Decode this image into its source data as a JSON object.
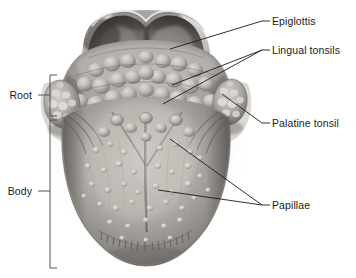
{
  "figure": {
    "style": "grayscale medical illustration",
    "width": 356,
    "height": 278,
    "background_color": "#ffffff",
    "text_color": "#1b1b1b",
    "leader_line_color": "#1b1b1b",
    "bracket_color": "#555555"
  },
  "labels": {
    "epiglottis": "Epiglottis",
    "lingual_tonsils": "Lingual tonsils",
    "palatine_tonsil": "Palatine tonsil",
    "papillae": "Papillae",
    "root": "Root",
    "body": "Body"
  },
  "callouts": [
    {
      "id": "epiglottis",
      "label": "Epiglottis",
      "side": "right",
      "text_x": 272,
      "text_y": 15,
      "dash_x1": 262,
      "dash_x2": 270,
      "dash_y": 21,
      "leaders": [
        {
          "x1": 262,
          "y1": 21,
          "x2": 170,
          "y2": 49
        }
      ]
    },
    {
      "id": "lingual-tonsils",
      "label": "Lingual tonsils",
      "side": "right",
      "text_x": 272,
      "text_y": 44,
      "dash_x1": 262,
      "dash_x2": 270,
      "dash_y": 50,
      "leaders": [
        {
          "x1": 262,
          "y1": 50,
          "x2": 172,
          "y2": 85
        },
        {
          "x1": 262,
          "y1": 50,
          "x2": 163,
          "y2": 104
        }
      ]
    },
    {
      "id": "palatine-tonsil",
      "label": "Palatine tonsil",
      "side": "right",
      "text_x": 272,
      "text_y": 117,
      "dash_x1": 262,
      "dash_x2": 270,
      "dash_y": 123,
      "leaders": [
        {
          "x1": 262,
          "y1": 123,
          "x2": 222,
          "y2": 94
        }
      ]
    },
    {
      "id": "papillae",
      "label": "Papillae",
      "side": "right",
      "text_x": 272,
      "text_y": 199,
      "dash_x1": 262,
      "dash_x2": 270,
      "dash_y": 205,
      "leaders": [
        {
          "x1": 262,
          "y1": 205,
          "x2": 170,
          "y2": 139
        },
        {
          "x1": 262,
          "y1": 205,
          "x2": 158,
          "y2": 190
        }
      ]
    }
  ],
  "brackets": [
    {
      "id": "root",
      "label": "Root",
      "text_x": 10,
      "text_y": 89,
      "tick_x1": 38,
      "tick_x2": 50,
      "tick_y": 95,
      "spine_x": 50,
      "spine_y1": 75,
      "spine_y2": 116,
      "arm_len": 7
    },
    {
      "id": "body",
      "label": "Body",
      "text_x": 10,
      "text_y": 185,
      "tick_x1": 38,
      "tick_x2": 50,
      "tick_y": 191,
      "spine_x": 50,
      "spine_y1": 120,
      "spine_y2": 268,
      "arm_len": 7
    }
  ],
  "structures": [
    {
      "name": "epiglottis",
      "description": "dark leaf-shaped flap at the top, behind the tongue root"
    },
    {
      "name": "lingual-tonsils",
      "description": "cobblestone nodular lymphoid tissue covering the tongue root"
    },
    {
      "name": "palatine-tonsil",
      "description": "oval pitted lymphoid mass on each lateral side"
    },
    {
      "name": "papillae",
      "description": "small rounded bumps scattered across the tongue body"
    },
    {
      "name": "median-sulcus",
      "description": "midline groove running down the body of the tongue"
    },
    {
      "name": "terminal-sulcus",
      "description": "V-shaped groove separating root from body"
    },
    {
      "name": "tongue-body",
      "description": "anterior two-thirds of the tongue"
    },
    {
      "name": "tongue-root",
      "description": "posterior one-third of the tongue"
    }
  ]
}
